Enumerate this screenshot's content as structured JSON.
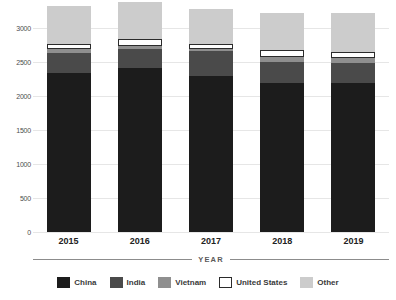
{
  "chart_data": {
    "type": "bar",
    "subtype": "stacked-vertical",
    "title": "",
    "xlabel": "YEAR",
    "ylabel": "",
    "categories": [
      "2015",
      "2016",
      "2017",
      "2018",
      "2019"
    ],
    "ylim": [
      0,
      3300
    ],
    "yticks": [
      0,
      500,
      1000,
      1500,
      2000,
      2500,
      3000
    ],
    "ytick_labels": [
      "0",
      "500",
      "1000",
      "1500",
      "2000",
      "2500",
      "3000"
    ],
    "grid": true,
    "grid_axis": "y",
    "legend_position": "bottom",
    "series": [
      {
        "name": "China",
        "color": "#1c1c1c",
        "border": "none",
        "values": [
          2340,
          2410,
          2300,
          2190,
          2190
        ]
      },
      {
        "name": "India",
        "color": "#4a4a4a",
        "border": "none",
        "values": [
          300,
          290,
          360,
          310,
          300
        ]
      },
      {
        "name": "Vietnam",
        "color": "#8f8f8f",
        "border": "none",
        "values": [
          60,
          40,
          40,
          80,
          70
        ]
      },
      {
        "name": "United States",
        "color": "#ffffff",
        "border": "#2b2b2b",
        "values": [
          75,
          105,
          75,
          100,
          95
        ]
      },
      {
        "name": "Other",
        "color": "#cccccc",
        "border": "none",
        "values": [
          555,
          545,
          515,
          540,
          565
        ]
      }
    ],
    "totals": [
      3330,
      3390,
      3290,
      3220,
      3220
    ]
  },
  "axis": {
    "x_title": "YEAR"
  },
  "legend": {
    "items": [
      {
        "label": "China"
      },
      {
        "label": "India"
      },
      {
        "label": "Vietnam"
      },
      {
        "label": "United States"
      },
      {
        "label": "Other"
      }
    ]
  },
  "colors": {
    "gridline": "#e6e6e6",
    "axis_rule": "#8c8c8c",
    "tick_text": "#4d4d4d",
    "category_text": "#222222",
    "legend_text": "#3a3a3a",
    "background": "#ffffff"
  }
}
